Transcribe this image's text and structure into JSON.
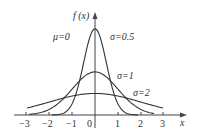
{
  "chart_data": {
    "type": "line",
    "title": "",
    "xlabel": "x",
    "ylabel": "f (x)",
    "xlim": [
      -3.2,
      3.3
    ],
    "ylim": [
      0,
      0.85
    ],
    "grid": false,
    "x_ticks": [
      "-3",
      "-2",
      "-1",
      "0",
      "1",
      "2",
      "3"
    ],
    "annotations": [
      "μ=0",
      "σ=0.5",
      "σ=1",
      "σ=2"
    ],
    "series": [
      {
        "name": "σ=0.5",
        "mu": 0,
        "sigma": 0.5,
        "x": [
          -1.9,
          -1.5,
          -1,
          -0.5,
          0,
          0.5,
          1,
          1.5,
          1.9
        ],
        "values": [
          0.0006,
          0.0089,
          0.108,
          0.484,
          0.798,
          0.484,
          0.108,
          0.0089,
          0.0006
        ]
      },
      {
        "name": "σ=1",
        "mu": 0,
        "sigma": 1,
        "x": [
          -2.9,
          -2,
          -1,
          0,
          1,
          2,
          2.6
        ],
        "values": [
          0.006,
          0.054,
          0.242,
          0.399,
          0.242,
          0.054,
          0.0136
        ]
      },
      {
        "name": "σ=2",
        "mu": 0,
        "sigma": 2,
        "x": [
          -3,
          -2,
          -1,
          0,
          1,
          2,
          3
        ],
        "values": [
          0.065,
          0.121,
          0.176,
          0.199,
          0.176,
          0.121,
          0.065
        ]
      }
    ]
  },
  "labels": {
    "ylabel": "f (x)",
    "xlabel": "x",
    "mu": "μ=0",
    "s05": "σ=0.5",
    "s1": "σ=1",
    "s2": "σ=2",
    "t_m3": "−3",
    "t_m2": "−2",
    "t_m1": "−1",
    "t_0": "0",
    "t_1": "1",
    "t_2": "2",
    "t_3": "3"
  }
}
